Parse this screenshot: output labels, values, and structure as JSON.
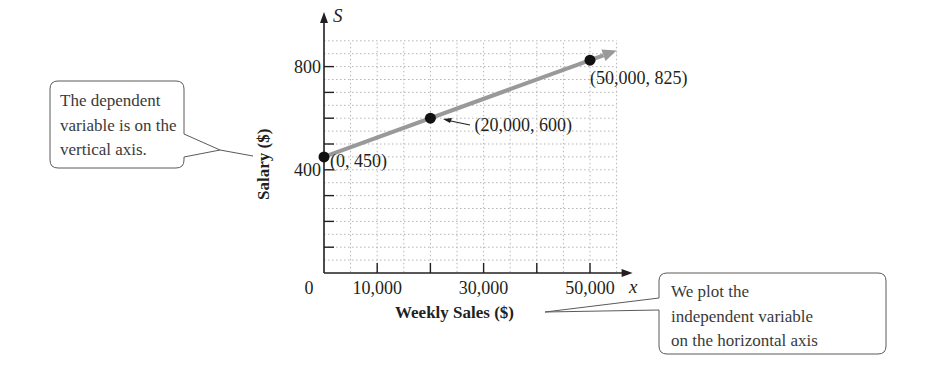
{
  "chart_data": {
    "type": "line",
    "title": "",
    "xlabel": "Weekly Sales ($)",
    "ylabel": "Salary ($)",
    "x_axis_variable": "x",
    "y_axis_variable": "S",
    "xlim": [
      0,
      55000
    ],
    "ylim": [
      0,
      900
    ],
    "x_ticks": [
      10000,
      20000,
      30000,
      40000,
      50000
    ],
    "x_tick_labels": [
      "0",
      "10,000",
      "30,000",
      "50,000"
    ],
    "x_tick_label_values": [
      0,
      10000,
      30000,
      50000
    ],
    "y_ticks": [
      100,
      200,
      300,
      400,
      500,
      600,
      700,
      800
    ],
    "y_tick_labels": [
      "400",
      "800"
    ],
    "y_tick_label_values": [
      400,
      800
    ],
    "grid": true,
    "series": [
      {
        "name": "Salary line",
        "color": "#999999",
        "x": [
          0,
          55000
        ],
        "y": [
          450,
          862.5
        ],
        "arrow_end": true
      }
    ],
    "points": [
      {
        "x": 0,
        "y": 450,
        "label": "(0, 450)"
      },
      {
        "x": 20000,
        "y": 600,
        "label": "(20,000, 600)"
      },
      {
        "x": 50000,
        "y": 825,
        "label": "(50,000, 825)"
      }
    ],
    "annotations": [
      {
        "target": "y-axis",
        "lines": [
          "The dependent",
          "variable is on the",
          "vertical axis."
        ]
      },
      {
        "target": "x-axis-title",
        "lines": [
          "We plot the",
          "independent variable",
          "on the horizontal axis"
        ]
      }
    ]
  }
}
